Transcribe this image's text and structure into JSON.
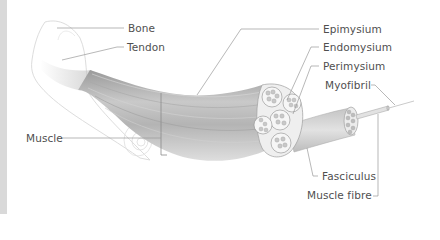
{
  "diagram": {
    "labels": {
      "bone": "Bone",
      "tendon": "Tendon",
      "muscle": "Muscle",
      "epimysium": "Epimysium",
      "endomysium": "Endomysium",
      "perimysium": "Perimysium",
      "myofibril": "Myofibril",
      "fasciculus": "Fasciculus",
      "muscle_fibre": "Muscle fibre"
    },
    "colors": {
      "side_stripe": "#d9d9d9",
      "label_text": "#4f4f4f",
      "leader_line": "#9a9a9a",
      "bone_outline": "#dcdcdc",
      "muscle_dark": "#8c8c8c",
      "muscle_light": "#e6e6e6"
    }
  }
}
